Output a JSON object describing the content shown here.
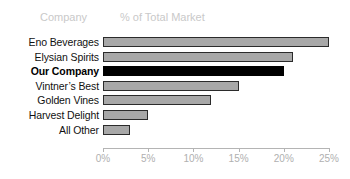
{
  "header": {
    "category_header": "Company",
    "value_header": "% of Total Market"
  },
  "chart_data": {
    "type": "bar",
    "orientation": "horizontal",
    "title": "",
    "subtitle": "",
    "xlabel": "% of Total Market",
    "ylabel": "Company",
    "categories": [
      "Eno Beverages",
      "Elysian Spirits",
      "Our Company",
      "Vintner’s Best",
      "Golden Vines",
      "Harvest Delight",
      "All Other"
    ],
    "values": [
      25,
      21,
      20,
      15,
      12,
      5,
      3
    ],
    "highlight_category": "Our Company",
    "highlight_index": 2,
    "xlim": [
      0,
      25
    ],
    "xticks": [
      0,
      5,
      10,
      15,
      20,
      25
    ],
    "xtick_labels": [
      "0%",
      "5%",
      "10%",
      "15%",
      "20%",
      "25%"
    ],
    "grid": false,
    "legend": false,
    "colors": {
      "bar_fill": "#a8a8a8",
      "bar_border": "#2b2b2b",
      "highlight_fill": "#000000",
      "axis": "#b4b4b4",
      "tick_label": "#b0b0b0",
      "header_text": "#c9c9c9",
      "label_text": "#111111",
      "background": "#ffffff"
    }
  }
}
